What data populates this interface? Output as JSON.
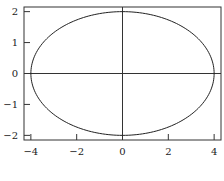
{
  "chart_data": {
    "type": "line",
    "title": "",
    "xlabel": "",
    "ylabel": "",
    "xlim": [
      -4.3,
      4.3
    ],
    "ylim": [
      -2.15,
      2.15
    ],
    "grid": false,
    "legend": null,
    "x_ticks": [
      -4,
      -2,
      0,
      2,
      4
    ],
    "x_tick_labels": [
      "−4",
      "−2",
      "0",
      "2",
      "4"
    ],
    "y_ticks": [
      -2,
      -1,
      0,
      1,
      2
    ],
    "y_tick_labels": [
      "−2",
      "−1",
      "0",
      "1",
      "2"
    ],
    "axes_lines": {
      "x0": true,
      "y0": true
    },
    "series": [
      {
        "name": "ellipse",
        "parametric": "x = 4 cos(t), y = 2 sin(t)",
        "semi_axis_x": 4,
        "semi_axis_y": 2,
        "center": [
          0,
          0
        ],
        "color": "#222222"
      }
    ]
  },
  "layout": {
    "plot_px": {
      "left": 24,
      "top": 7,
      "right": 221,
      "bottom": 140
    }
  }
}
